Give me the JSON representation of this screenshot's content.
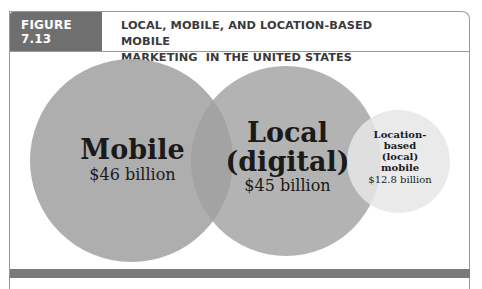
{
  "figure": {
    "label": "FIGURE 7.13",
    "title_line1": "LOCAL, MOBILE, AND LOCATION-BASED MOBILE",
    "title_line2": "MARKETING  IN THE UNITED STATES"
  },
  "chart_data": {
    "type": "bubble",
    "title": "LOCAL, MOBILE, AND LOCATION-BASED MOBILE MARKETING IN THE UNITED STATES",
    "unit": "billion USD",
    "categories": [
      "Mobile",
      "Local (digital)",
      "Location-based (local) mobile"
    ],
    "values": [
      46,
      45,
      12.8
    ],
    "labels": [
      "$46 billion",
      "$45 billion",
      "$12.8 billion"
    ],
    "overlapping": true,
    "colors": [
      "#aaaaaa",
      "#a0a0a0",
      "#e6e6e6"
    ]
  },
  "circles": {
    "mobile": {
      "name": "Mobile",
      "value": "$46 billion"
    },
    "local": {
      "name_line1": "Local",
      "name_line2": "(digital)",
      "value": "$45 billion"
    },
    "location": {
      "name_line1": "Location-",
      "name_line2": "based",
      "name_line3": "(local)",
      "name_line4": "mobile",
      "value": "$12.8 billion"
    }
  }
}
